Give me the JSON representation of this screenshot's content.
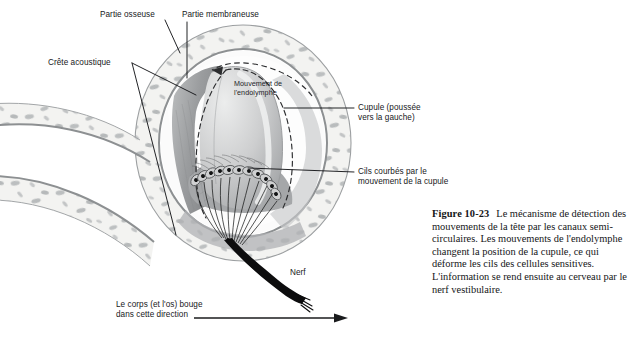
{
  "figure": {
    "type": "anatomical-diagram",
    "language": "fr"
  },
  "labels": {
    "partie_osseuse": "Partie osseuse",
    "partie_membraneuse": "Partie membraneuse",
    "crete_acoustique": "Crête acoustique",
    "mouvement_endolymphe_l1": "Mouvement de",
    "mouvement_endolymphe_l2": "l'endolymphe",
    "cupule_l1": "Cupule (poussée",
    "cupule_l2": "vers la gauche)",
    "cils_l1": "Cils courbés par le",
    "cils_l2": "mouvement de la cupule",
    "nerf": "Nerf",
    "direction_l1": "Le corps (et l'os) bouge",
    "direction_l2": "dans cette direction"
  },
  "caption": {
    "number": "Figure 10-23",
    "text": "Le mécanisme de détection des mouvements de la tête par les canaux semi-circulaires. Les mouvements de l'endolymphe changent la position de la cupule, ce qui déforme les cils des cellules sensitives. L'information se rend ensuite au cerveau par le nerf vestibulaire."
  },
  "colors": {
    "page_background": "#ffffff",
    "bone_fill": "#f1f1ef",
    "bone_speckle": "#b9bcbd",
    "bone_outline": "#8e9193",
    "membrane_gray": "#9a9b9d",
    "cupula_gray": "#c9cacb",
    "crista_gray": "#a9aaac",
    "nerve_black": "#0c0c0c",
    "leader_line": "#16171a",
    "text": "#17181a"
  }
}
